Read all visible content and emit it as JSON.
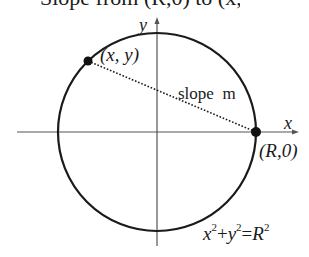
{
  "figure": {
    "top_caption_fragment": "Slope from (R,0) to (x,y)",
    "axis_x_label": "x",
    "axis_y_label": "y",
    "point_general_label": "(x, y)",
    "point_fixed_label": "(R,0)",
    "line_label": "slope  m",
    "equation": {
      "t1": "x",
      "e1": "2",
      "plus": "+",
      "t2": "y",
      "e2": "2",
      "eq": "=",
      "t3": "R",
      "e3": "2"
    },
    "colors": {
      "stroke": "#1a1a1a",
      "axis": "#555555",
      "background": "#ffffff"
    },
    "geometry": {
      "center": [
        157,
        132
      ],
      "radius": 98,
      "point_general": [
        88,
        61
      ],
      "point_fixed": [
        256,
        132
      ]
    }
  }
}
